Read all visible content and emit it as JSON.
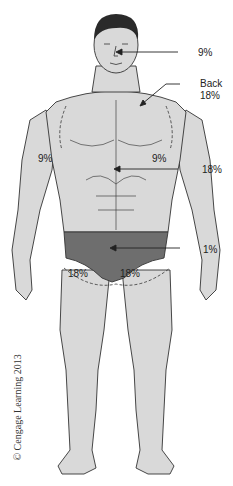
{
  "diagram": {
    "type": "rule-of-nines body surface area (anterior view)",
    "labels": {
      "head": "9%",
      "back_title": "Back",
      "back_value": "18%",
      "left_arm": "9%",
      "right_arm": "9%",
      "front_trunk": "18%",
      "perineum": "1%",
      "left_leg": "18%",
      "right_leg": "18%"
    },
    "copyright": "© Cengage Learning 2013",
    "colors": {
      "skin": "#d9d9d9",
      "outline": "#333333",
      "briefs": "#6e6e6e",
      "hair": "#2a2a2a"
    }
  }
}
